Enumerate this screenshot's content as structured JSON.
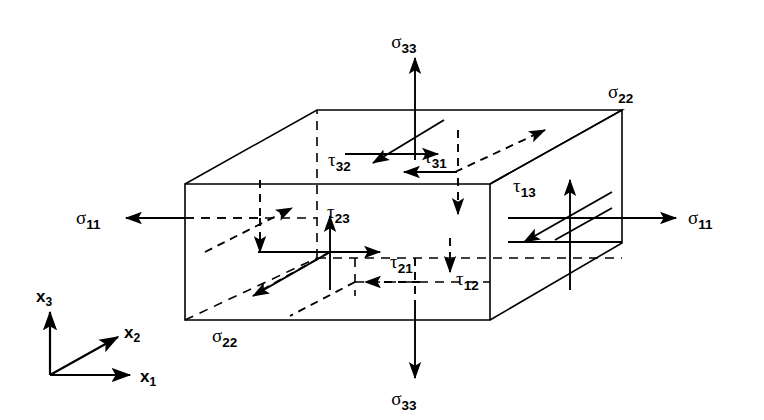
{
  "figure": {
    "type": "stress-tensor-cube-diagram"
  },
  "axes": {
    "origin_label": "",
    "items": [
      {
        "name": "x3",
        "base": "x",
        "sub": "3",
        "direction": "up"
      },
      {
        "name": "x2",
        "base": "x",
        "sub": "2",
        "direction": "up-right-diagonal"
      },
      {
        "name": "x1",
        "base": "x",
        "sub": "1",
        "direction": "right"
      }
    ]
  },
  "normal_stresses": [
    {
      "name": "sigma-33-top",
      "base": "σ",
      "sub": "33",
      "face": "top",
      "direction": "up",
      "label_x": 415,
      "label_y": 48
    },
    {
      "name": "sigma-33-bottom",
      "base": "σ",
      "sub": "33",
      "face": "bottom",
      "direction": "down",
      "label_x": 415,
      "label_y": 405
    },
    {
      "name": "sigma-11-left",
      "base": "σ",
      "sub": "11",
      "face": "left",
      "direction": "left",
      "label_x": 88,
      "label_y": 224
    },
    {
      "name": "sigma-11-right",
      "base": "σ",
      "sub": "11",
      "face": "right",
      "direction": "right",
      "label_x": 700,
      "label_y": 224
    },
    {
      "name": "sigma-22-back",
      "base": "σ",
      "sub": "22",
      "face": "back",
      "direction": "up-right-diagonal",
      "label_x": 630,
      "label_y": 98
    },
    {
      "name": "sigma-22-front",
      "base": "σ",
      "sub": "22",
      "face": "front",
      "direction": "down-left-diagonal",
      "label_x": 222,
      "label_y": 342
    }
  ],
  "shear_stresses": [
    {
      "name": "tau-32",
      "base": "τ",
      "sub": "32",
      "face": "top",
      "direction": "down-left-diagonal",
      "label_x": 336,
      "label_y": 166
    },
    {
      "name": "tau-31",
      "base": "τ",
      "sub": "31",
      "face": "top",
      "direction": "left",
      "label_x": 429,
      "label_y": 163
    },
    {
      "name": "tau-23",
      "base": "τ",
      "sub": "23",
      "face": "front",
      "direction": "up",
      "label_x": 332,
      "label_y": 218
    },
    {
      "name": "tau-21",
      "base": "τ",
      "sub": "21",
      "face": "front",
      "direction": "right",
      "label_x": 396,
      "label_y": 268
    },
    {
      "name": "tau-13",
      "base": "τ",
      "sub": "13",
      "face": "right",
      "direction": "up",
      "label_x": 519,
      "label_y": 192
    },
    {
      "name": "tau-12",
      "base": "τ",
      "sub": "12",
      "face": "right",
      "direction": "down",
      "label_x": 462,
      "label_y": 285
    }
  ],
  "geometry": {
    "front_face": {
      "x1": 185,
      "y1": 184,
      "x2": 490,
      "y2": 320
    },
    "depth_dx": 132,
    "depth_dy": -74,
    "front_center": {
      "x": 330,
      "y": 252
    },
    "top_center": {
      "x": 415,
      "y": 135
    },
    "right_center": {
      "x": 570,
      "y": 215
    },
    "back_center": {
      "x": 460,
      "y": 180
    }
  },
  "colors": {
    "stroke": "#000000",
    "background": "#ffffff"
  }
}
